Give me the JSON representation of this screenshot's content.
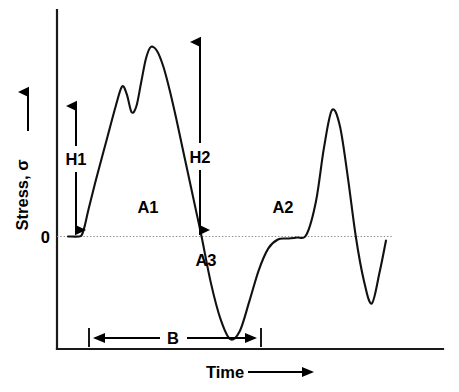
{
  "figure": {
    "background_color": "#ffffff",
    "trace_color": "#111111",
    "axis_color": "#1a1a1a",
    "zero_line_color": "#8d8d8d"
  },
  "axes": {
    "y_title": "Stress, σ",
    "y_zero_tick": "0",
    "x_title": "Time"
  },
  "annotations": {
    "h1": "H1",
    "h2": "H2",
    "a1": "A1",
    "a2": "A2",
    "a3": "A3",
    "b": "B"
  },
  "chart_data": {
    "type": "line",
    "title": "",
    "subtitle": "",
    "xlabel": "Time",
    "ylabel": "Stress, σ",
    "xlim": [
      0,
      100
    ],
    "ylim": [
      -55,
      100
    ],
    "grid": false,
    "legend": null,
    "tick_labels": {
      "y": [
        "0"
      ],
      "x": []
    },
    "series": [
      {
        "name": "stress",
        "description": "Two-cycle stress waveform: first cycle has a double-peaked positive lobe (A1) followed by a deep negative lobe (A3); second cycle has a single positive peak (A2) followed by a shallower negative lobe, then decay to zero.",
        "x": [
          0.0,
          3.5,
          4.4,
          5.2,
          6.5,
          9.0,
          12.0,
          15.0,
          17.0,
          18.5,
          20.0,
          21.5,
          23.0,
          24.5,
          26.0,
          28.0,
          30.0,
          32.0,
          34.0,
          36.0,
          38.0,
          40.0,
          42.0,
          45.0,
          48.0,
          51.0,
          54.0,
          57.0,
          60.0,
          63.0,
          66.0,
          69.0,
          72.0,
          75.0,
          78.0,
          80.5,
          83.0,
          85.5,
          88.0,
          90.5,
          93.0,
          95.5,
          98.0,
          100.0
        ],
        "y": [
          0.0,
          0.0,
          1.0,
          5.0,
          14.0,
          30.0,
          48.0,
          66.0,
          76.0,
          72.0,
          63.0,
          66.0,
          78.0,
          90.0,
          96.0,
          94.0,
          86.0,
          74.0,
          60.0,
          45.0,
          30.0,
          15.0,
          0.0,
          -24.0,
          -42.0,
          -52.0,
          -48.0,
          -33.0,
          -17.0,
          -6.0,
          -1.5,
          -1.0,
          -0.5,
          1.0,
          18.0,
          45.0,
          64.0,
          56.0,
          30.0,
          0.0,
          -22.0,
          -34.0,
          -18.0,
          -2.0
        ],
        "color": "#111111"
      }
    ],
    "annotations": [
      {
        "id": "H1",
        "label": "H1",
        "kind": "vertical-double-arrow",
        "meaning": "height of first positive shoulder above baseline"
      },
      {
        "id": "H2",
        "label": "H2",
        "kind": "vertical-double-arrow",
        "meaning": "height from baseline to first-cycle maximum peak"
      },
      {
        "id": "A1",
        "label": "A1",
        "kind": "area-label",
        "meaning": "area under first positive lobe"
      },
      {
        "id": "A2",
        "label": "A2",
        "kind": "area-label",
        "meaning": "area under second positive lobe"
      },
      {
        "id": "A3",
        "label": "A3",
        "kind": "area-label",
        "meaning": "area of first negative lobe"
      },
      {
        "id": "B",
        "label": "B",
        "kind": "horizontal-double-arrow",
        "meaning": "time span / breadth of the first cycle"
      }
    ]
  }
}
